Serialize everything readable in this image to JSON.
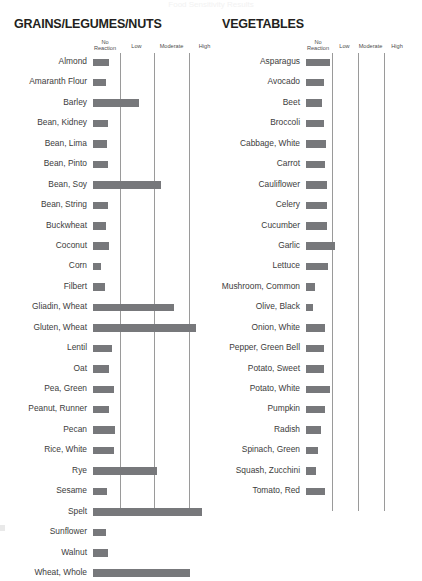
{
  "top_clipped_text": "Food Sensitivity Results",
  "chart_data": {
    "type": "bar",
    "orientation": "horizontal",
    "xlabel": "",
    "ylabel": "",
    "scale_headers": [
      "No Reaction",
      "Low",
      "Moderate",
      "High"
    ],
    "grid": true,
    "legend_position": "top",
    "axis_range": [
      0,
      4
    ],
    "bar_color": "#77787b",
    "gridline_color": "#9a9a9a",
    "panels": [
      {
        "title": "GRAINS/LEGUMES/NUTS",
        "categories": [
          "Almond",
          "Amaranth Flour",
          "Barley",
          "Bean, Kidney",
          "Bean, Lima",
          "Bean, Pinto",
          "Bean, Soy",
          "Bean, String",
          "Buckwheat",
          "Coconut",
          "Corn",
          "Filbert",
          "Gliadin, Wheat",
          "Gluten, Wheat",
          "Lentil",
          "Oat",
          "Pea, Green",
          "Peanut, Runner",
          "Pecan",
          "Rice, White",
          "Rye",
          "Sesame",
          "Spelt",
          "Sunflower",
          "Walnut",
          "Wheat, Whole"
        ],
        "values": [
          0.62,
          0.5,
          1.72,
          0.55,
          0.52,
          0.58,
          2.55,
          0.58,
          0.48,
          0.62,
          0.3,
          0.45,
          3.06,
          3.9,
          0.72,
          0.62,
          0.8,
          0.62,
          0.82,
          0.8,
          2.4,
          0.52,
          4.1,
          0.5,
          0.55,
          3.65
        ]
      },
      {
        "title": "VEGETABLES",
        "categories": [
          "Asparagus",
          "Avocado",
          "Beet",
          "Broccoli",
          "Cabbage, White",
          "Carrot",
          "Cauliflower",
          "Celery",
          "Cucumber",
          "Garlic",
          "Lettuce",
          "Mushroom, Common",
          "Olive, Black",
          "Onion, White",
          "Pepper, Green Bell",
          "Potato, Sweet",
          "Potato, White",
          "Pumpkin",
          "Radish",
          "Spinach, Green",
          "Squash, Zucchini",
          "Tomato, Red"
        ],
        "values": [
          0.94,
          0.7,
          0.62,
          0.7,
          0.78,
          0.72,
          0.82,
          0.8,
          0.82,
          1.1,
          0.86,
          0.36,
          0.26,
          0.74,
          0.7,
          0.7,
          0.94,
          0.74,
          0.58,
          0.48,
          0.38,
          0.74
        ]
      }
    ]
  }
}
